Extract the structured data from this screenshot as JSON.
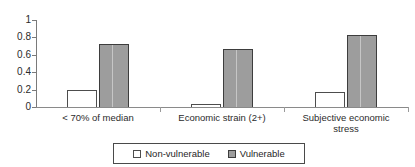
{
  "chart_data": {
    "type": "bar",
    "title": "",
    "subtitle": "",
    "xlabel": "",
    "ylabel": "",
    "categories": [
      "< 70% of median",
      "Economic strain  (2+)",
      "Subjective economic\nstress"
    ],
    "series": [
      {
        "name": "Non-vulnerable",
        "values": [
          0.19,
          0.03,
          0.17
        ],
        "color": "#ffffff"
      },
      {
        "name": "Vulnerable",
        "values": [
          0.72,
          0.67,
          0.83
        ],
        "color": "#9d9d9d"
      }
    ],
    "ylim": [
      0,
      1
    ],
    "yticks": [
      "0",
      "0.2",
      "0.4",
      "0.6",
      "0.8",
      "1"
    ],
    "ytick_values": [
      0,
      0.2,
      0.4,
      0.6,
      0.8,
      1
    ],
    "grid": false,
    "legend_position": "bottom"
  },
  "legend": {
    "items": [
      {
        "label": "Non-vulnerable"
      },
      {
        "label": "Vulnerable"
      }
    ]
  }
}
